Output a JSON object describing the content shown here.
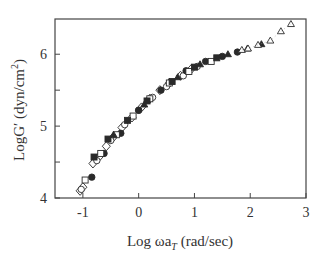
{
  "chart_data": {
    "type": "scatter",
    "title": "",
    "xlabel": "Log ωa_T (rad/sec)",
    "ylabel": "LogG′ (dyn/cm²)",
    "xlim": [
      -1.5,
      3
    ],
    "ylim": [
      4,
      6.49
    ],
    "xticks": [
      -1,
      0,
      1,
      2,
      3
    ],
    "yticks": [
      4,
      5,
      6
    ],
    "yminor_ticks": [
      4.5,
      5.5
    ],
    "grid": false,
    "legend": null,
    "series": [
      {
        "name": "open-diamond",
        "marker": "diamond-open",
        "x": [
          -1.05,
          -1.0,
          -0.82,
          -0.7,
          -0.58,
          -0.45,
          -0.3,
          -0.12,
          0.05,
          0.2,
          0.38,
          0.55,
          0.75,
          0.95
        ],
        "y": [
          4.1,
          4.15,
          4.48,
          4.58,
          4.72,
          4.85,
          4.98,
          5.12,
          5.26,
          5.38,
          5.5,
          5.6,
          5.7,
          5.8
        ]
      },
      {
        "name": "open-circle",
        "marker": "circle-open",
        "x": [
          -1.03,
          -0.75,
          -0.5,
          -0.25,
          0.0,
          0.25,
          0.5,
          0.8,
          1.05
        ],
        "y": [
          4.12,
          4.52,
          4.8,
          5.02,
          5.22,
          5.4,
          5.55,
          5.7,
          5.83
        ]
      },
      {
        "name": "filled-circle",
        "marker": "circle-filled",
        "x": [
          -0.84,
          -0.62,
          -0.32,
          0.0,
          0.4,
          0.85,
          1.2,
          1.5,
          1.77
        ],
        "y": [
          4.29,
          4.62,
          4.9,
          5.22,
          5.5,
          5.77,
          5.9,
          5.97,
          6.03
        ]
      },
      {
        "name": "open-square",
        "marker": "square-open",
        "x": [
          -0.96,
          -0.68,
          -0.4,
          -0.1,
          0.2,
          0.55,
          0.9,
          1.3
        ],
        "y": [
          4.25,
          4.62,
          4.88,
          5.14,
          5.38,
          5.6,
          5.76,
          5.9
        ]
      },
      {
        "name": "filled-square",
        "marker": "square-filled",
        "x": [
          -0.8,
          -0.55,
          -0.2,
          0.15,
          0.6,
          1.0,
          1.4
        ],
        "y": [
          4.57,
          4.82,
          5.08,
          5.35,
          5.62,
          5.82,
          5.95
        ]
      },
      {
        "name": "filled-triangle",
        "marker": "triangle-filled",
        "x": [
          -0.45,
          0.1,
          0.7,
          1.1,
          1.6,
          1.95,
          2.2
        ],
        "y": [
          4.88,
          5.3,
          5.68,
          5.86,
          6.0,
          6.08,
          6.14
        ]
      },
      {
        "name": "open-triangle",
        "marker": "triangle-open",
        "x": [
          1.85,
          1.96,
          2.14,
          2.36,
          2.55,
          2.73
        ],
        "y": [
          6.06,
          6.08,
          6.13,
          6.19,
          6.32,
          6.42
        ]
      }
    ]
  },
  "axes": {
    "x_tick_labels": [
      "-1",
      "0",
      "1",
      "2",
      "3"
    ],
    "y_tick_labels": [
      "4",
      "5",
      "6"
    ],
    "x_title_main": "Log ωa",
    "x_title_sub": "T",
    "x_title_unit": " (rad/sec)",
    "y_title_main": "LogG′ (dyn/cm",
    "y_title_sup": "2",
    "y_title_end": ")"
  },
  "colors": {
    "axis": "#444444",
    "marker": "#2a2a2a",
    "background": "#ffffff"
  }
}
